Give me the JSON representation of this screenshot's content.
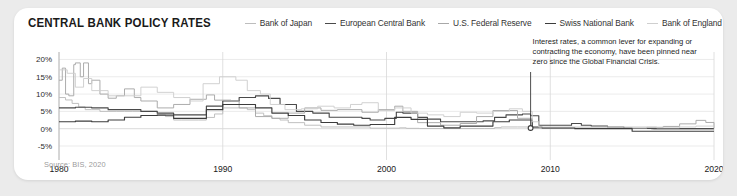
{
  "card": {
    "title": "CENTRAL BANK POLICY RATES",
    "source": "Source: BIS, 2020"
  },
  "annotation": {
    "line1": "Interest rates, a common lever for expanding or",
    "line2": "contracting the economy, have been pinned near",
    "line3": "zero since the Global Financial Crisis.",
    "anchor_year": 2008.8,
    "anchor_value": 0.2
  },
  "colors": {
    "boj": "#bdbdbd",
    "ecb": "#4a4a4a",
    "fed": "#a8a8a8",
    "snb": "#3c3c3c",
    "boe": "#cfcfcf",
    "grid": "#e6e6e6",
    "axis": "#b5b5b5",
    "text": "#1a1a1a",
    "muted": "#9b9b9b",
    "card_bg": "#ffffff",
    "page_bg": "#ebebeb"
  },
  "chart_data": {
    "type": "line",
    "title": "CENTRAL BANK POLICY RATES",
    "xlabel": "",
    "ylabel": "",
    "xlim": [
      1980,
      2020
    ],
    "ylim": [
      -5,
      21
    ],
    "grid": true,
    "legend_position": "top-right",
    "xticks": [
      1980,
      1990,
      2000,
      2010,
      2020
    ],
    "xtick_labels": [
      "1980",
      "1990",
      "2000",
      "2010",
      "2020"
    ],
    "yticks": [
      20,
      15,
      10,
      5,
      0,
      -5
    ],
    "ytick_labels": [
      "20%",
      "15%",
      "10%",
      "5%",
      "0%",
      "-5%"
    ],
    "series": [
      {
        "name": "Bank of Japan",
        "color": "#bdbdbd",
        "x": [
          1980.0,
          1980.4,
          1980.8,
          1981.2,
          1981.6,
          1982.0,
          1982.5,
          1983.0,
          1983.5,
          1984.0,
          1984.5,
          1985.0,
          1985.5,
          1986.0,
          1986.5,
          1987.0,
          1987.5,
          1988.0,
          1988.5,
          1989.0,
          1989.5,
          1990.0,
          1990.5,
          1991.0,
          1991.5,
          1992.0,
          1992.5,
          1993.0,
          1993.5,
          1994.0,
          1995.0,
          1996.0,
          1997.0,
          1998.0,
          1999.0,
          2000.0,
          2000.8,
          2001.2,
          2002.0,
          2004.0,
          2006.0,
          2006.6,
          2007.0,
          2008.0,
          2008.8,
          2009.0,
          2012.0,
          2016.0,
          2016.3,
          2020.0
        ],
        "y": [
          9.0,
          8.3,
          7.3,
          6.3,
          5.5,
          5.5,
          5.0,
          5.0,
          5.0,
          5.0,
          5.0,
          5.0,
          5.0,
          4.0,
          3.5,
          2.5,
          2.5,
          2.5,
          2.5,
          3.25,
          4.25,
          6.0,
          6.0,
          6.0,
          5.5,
          4.5,
          3.75,
          3.0,
          2.5,
          1.75,
          1.0,
          0.5,
          0.5,
          0.5,
          0.15,
          0.15,
          0.25,
          0.1,
          0.05,
          0.05,
          0.05,
          0.3,
          0.5,
          0.5,
          0.3,
          0.1,
          0.1,
          0.05,
          -0.1,
          -0.1
        ],
        "note": "Japan: lower band in the 1980s, ZIRP from late 1990s, negative from 2016"
      },
      {
        "name": "European Central Bank",
        "color": "#4a4a4a",
        "x": [
          1980.0,
          1981.0,
          1982.0,
          1983.0,
          1984.0,
          1985.0,
          1986.0,
          1987.0,
          1988.0,
          1989.0,
          1990.0,
          1991.0,
          1992.0,
          1992.8,
          1993.5,
          1994.5,
          1995.5,
          1996.5,
          1997.5,
          1998.5,
          1999.0,
          1999.9,
          2000.6,
          2001.0,
          2001.9,
          2002.5,
          2003.3,
          2005.0,
          2005.9,
          2006.6,
          2007.3,
          2008.3,
          2008.8,
          2009.3,
          2011.3,
          2011.9,
          2012.5,
          2013.5,
          2014.5,
          2015.0,
          2016.2,
          2020.0
        ],
        "y": [
          6.0,
          6.2,
          6.0,
          5.5,
          5.5,
          5.0,
          4.5,
          4.0,
          4.0,
          6.5,
          8.0,
          9.0,
          9.5,
          8.75,
          7.0,
          5.0,
          4.5,
          3.3,
          3.3,
          3.0,
          2.5,
          3.0,
          4.75,
          4.5,
          3.25,
          2.75,
          2.0,
          2.0,
          2.25,
          3.25,
          4.0,
          4.25,
          3.75,
          1.0,
          1.5,
          1.0,
          0.75,
          0.5,
          0.15,
          0.05,
          0.0,
          0.0
        ],
        "note": "Euro-area: pre-1999 synthetic/Bundesbank-style path, then ECB refi rate"
      },
      {
        "name": "U.S. Federal Reserve",
        "color": "#a8a8a8",
        "x": [
          1980.0,
          1980.2,
          1980.4,
          1980.6,
          1980.9,
          1981.0,
          1981.3,
          1981.5,
          1981.8,
          1982.0,
          1982.5,
          1983.0,
          1983.5,
          1984.0,
          1984.6,
          1985.0,
          1986.0,
          1987.0,
          1988.0,
          1989.0,
          1989.5,
          1990.5,
          1991.0,
          1992.0,
          1993.0,
          1994.0,
          1995.0,
          1996.0,
          1997.0,
          1998.5,
          1999.5,
          2000.5,
          2001.0,
          2001.9,
          2003.3,
          2004.5,
          2005.5,
          2006.5,
          2007.5,
          2008.0,
          2008.9,
          2009.5,
          2015.9,
          2016.9,
          2017.9,
          2018.9,
          2019.5,
          2020.0
        ],
        "y": [
          14.0,
          17.5,
          10.0,
          9.5,
          18.5,
          19.0,
          15.0,
          19.0,
          13.0,
          14.0,
          10.0,
          8.8,
          9.5,
          11.5,
          9.0,
          8.0,
          6.0,
          7.0,
          8.5,
          9.75,
          8.25,
          8.0,
          6.0,
          3.5,
          3.0,
          4.5,
          6.0,
          5.3,
          5.5,
          4.75,
          5.5,
          6.5,
          5.0,
          1.75,
          1.0,
          1.5,
          3.5,
          5.25,
          5.25,
          3.0,
          0.25,
          0.15,
          0.4,
          0.65,
          1.4,
          2.4,
          1.8,
          0.15
        ],
        "note": "Fed funds target; Volcker spike early 1980s, ZIRP 2009-2015"
      },
      {
        "name": "Swiss National Bank",
        "color": "#3c3c3c",
        "x": [
          1980.0,
          1981.0,
          1982.0,
          1983.0,
          1984.0,
          1985.0,
          1986.0,
          1987.0,
          1988.0,
          1989.0,
          1990.0,
          1991.0,
          1992.0,
          1993.0,
          1994.0,
          1995.0,
          1996.0,
          1997.0,
          1998.0,
          1999.0,
          2000.5,
          2001.5,
          2002.5,
          2003.5,
          2004.5,
          2005.5,
          2006.5,
          2007.5,
          2008.5,
          2008.9,
          2009.5,
          2011.5,
          2014.9,
          2015.0,
          2020.0
        ],
        "y": [
          2.0,
          2.2,
          2.0,
          2.5,
          3.3,
          3.8,
          3.9,
          3.0,
          3.0,
          5.5,
          7.0,
          7.0,
          6.0,
          4.5,
          3.8,
          2.5,
          1.8,
          1.3,
          1.0,
          1.2,
          3.25,
          2.7,
          0.75,
          0.25,
          0.75,
          0.75,
          2.0,
          2.5,
          2.5,
          0.5,
          0.25,
          0.0,
          0.0,
          -0.75,
          -0.75
        ],
        "note": "SNB target; deeply negative -0.75% from January 2015"
      },
      {
        "name": "Bank of England",
        "color": "#cfcfcf",
        "x": [
          1980.0,
          1980.5,
          1981.0,
          1981.5,
          1982.0,
          1983.0,
          1984.0,
          1985.0,
          1986.0,
          1987.0,
          1988.0,
          1988.8,
          1989.8,
          1990.8,
          1991.5,
          1992.3,
          1992.9,
          1993.8,
          1994.8,
          1995.8,
          1996.8,
          1997.8,
          1998.5,
          1999.5,
          2000.5,
          2001.5,
          2002.5,
          2003.5,
          2004.5,
          2005.5,
          2006.5,
          2007.5,
          2008.3,
          2008.9,
          2009.3,
          2016.5,
          2017.9,
          2018.9,
          2020.0
        ],
        "y": [
          17.0,
          16.0,
          12.0,
          14.5,
          11.0,
          9.5,
          9.5,
          12.0,
          10.5,
          9.0,
          8.0,
          13.0,
          15.0,
          14.0,
          11.0,
          10.0,
          7.0,
          5.5,
          5.75,
          6.5,
          6.0,
          7.0,
          7.5,
          5.25,
          6.0,
          4.5,
          4.0,
          3.5,
          4.75,
          4.5,
          5.0,
          5.75,
          5.0,
          2.0,
          0.5,
          0.25,
          0.5,
          0.75,
          0.1
        ],
        "note": "Bank Rate; 0.5% floor after 2009, cut to 0.1% in March 2020"
      }
    ]
  },
  "legend": [
    {
      "label": "Bank of Japan",
      "color": "#bdbdbd"
    },
    {
      "label": "European Central Bank",
      "color": "#4a4a4a"
    },
    {
      "label": "U.S. Federal Reserve",
      "color": "#a8a8a8"
    },
    {
      "label": "Swiss National Bank",
      "color": "#3c3c3c"
    },
    {
      "label": "Bank of England",
      "color": "#cfcfcf"
    }
  ]
}
